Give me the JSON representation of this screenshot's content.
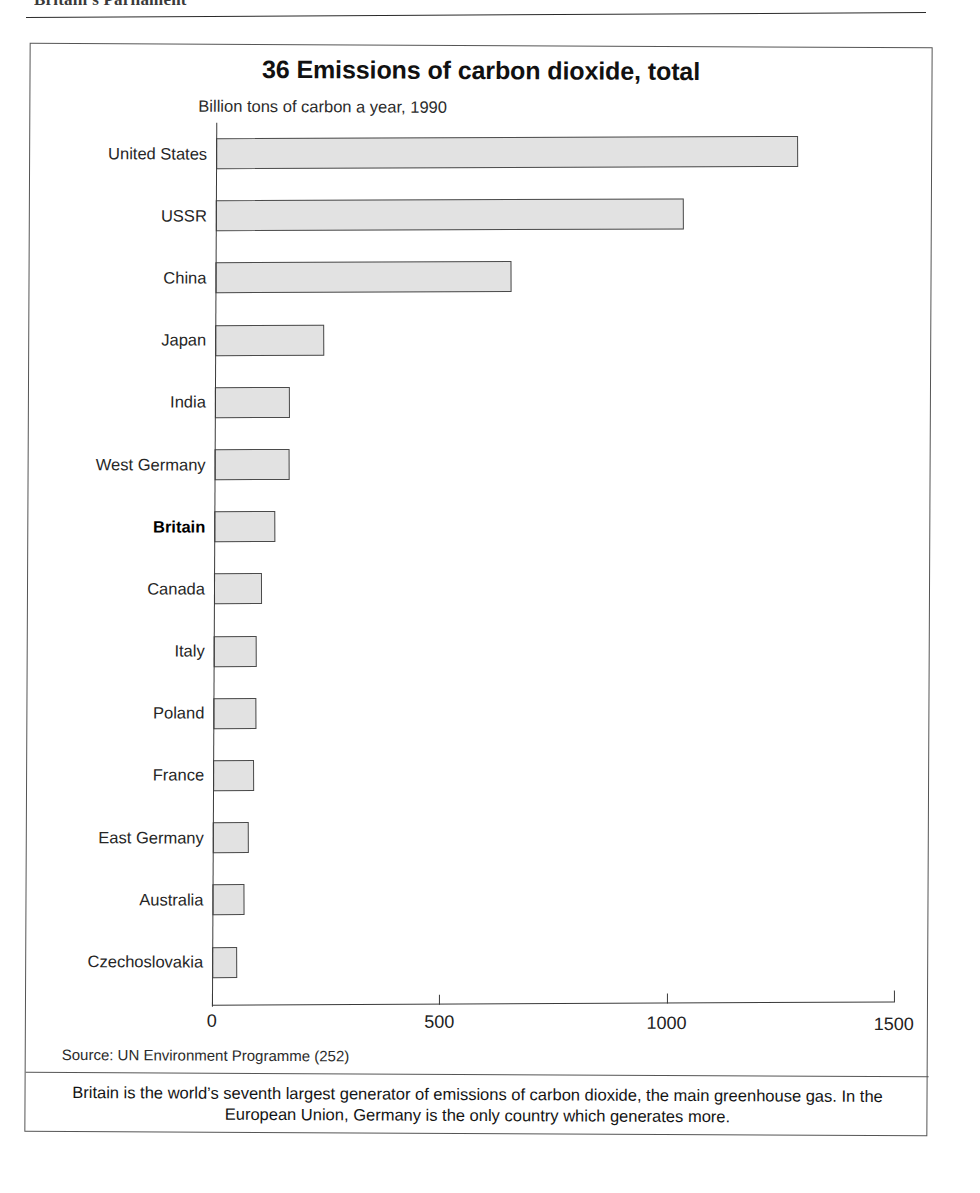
{
  "page_header": {
    "text": "Britain's Parliament",
    "note": "partially cropped running head at top of page"
  },
  "chart": {
    "title": "36 Emissions of carbon dioxide, total",
    "subtitle": "Billion tons of carbon a year, 1990",
    "source": "Source: UN Environment Programme (252)",
    "caption": "Britain is the world’s seventh largest generator of emissions of carbon dioxide, the main greenhouse gas. In the European Union, Germany is the only country which generates more.",
    "highlight_category": "Britain",
    "colors": {
      "bar_fill": "#e2e2e2",
      "bar_border": "#4a4a4a",
      "axis": "#3a3a3a",
      "frame": "#555555",
      "text": "#1a1a1a"
    }
  },
  "chart_data": {
    "type": "bar",
    "orientation": "horizontal",
    "title": "36 Emissions of carbon dioxide, total",
    "subtitle": "Billion tons of carbon a year, 1990",
    "xlabel": "",
    "ylabel": "",
    "xlim": [
      0,
      1500
    ],
    "xticks": [
      0,
      500,
      1000,
      1500
    ],
    "xtick_labels": [
      "0",
      "500",
      "1000",
      "1500"
    ],
    "grid": false,
    "legend": false,
    "categories": [
      "United States",
      "USSR",
      "China",
      "Japan",
      "India",
      "West Germany",
      "Britain",
      "Canada",
      "Italy",
      "Poland",
      "France",
      "East Germany",
      "Australia",
      "Czechoslovakia"
    ],
    "values": [
      1280,
      1030,
      650,
      240,
      165,
      165,
      135,
      105,
      95,
      95,
      90,
      80,
      70,
      55
    ]
  }
}
